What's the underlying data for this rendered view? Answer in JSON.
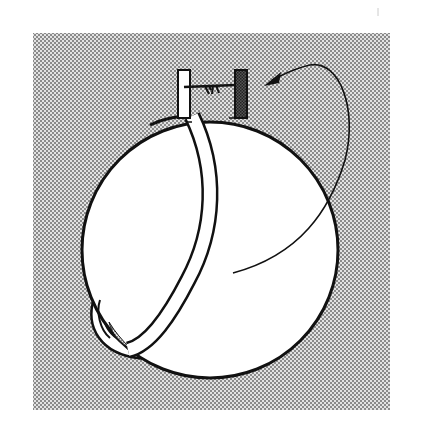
{
  "figure": {
    "colors": {
      "paper": "#ffffff",
      "stipple_dark": "#7a7a7a",
      "stipple_light": "#e6e6e6",
      "ink": "#111111",
      "sphere_fill": "#ffffff"
    },
    "elements": {
      "background_panel": "stippled-background",
      "sphere": "sphere",
      "ring": "ring-hoop",
      "left_post": "white-post",
      "right_post": "dark-hatched-post",
      "wire": "wire",
      "knot": "wire-knot",
      "arrow": "rotation-arrow"
    }
  }
}
